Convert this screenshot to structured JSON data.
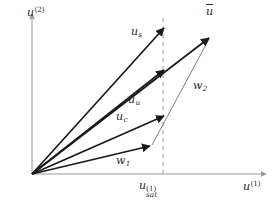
{
  "figure": {
    "background_color": "#ffffff",
    "axis_color": "#9a9a9a",
    "vector_color": "#1a1a1a",
    "thin_vector_color": "#707070",
    "dashed_line_color": "#b0b0b0",
    "text_color": "#2b2b2b",
    "width": 278,
    "height": 208
  },
  "axes": {
    "x": {
      "label_base": "u",
      "label_sup": "(1)",
      "origin_px": [
        32,
        174
      ],
      "end_px": [
        268,
        174
      ]
    },
    "y": {
      "label_base": "u",
      "label_sup": "(2)",
      "origin_px": [
        32,
        174
      ],
      "end_px": [
        32,
        12
      ]
    }
  },
  "saturation_line": {
    "name": "u_sat^(1)",
    "label_base": "u",
    "label_sub": "sat",
    "label_sup": "(1)",
    "x_px": 163,
    "style": "dashed"
  },
  "vectors": [
    {
      "id": "u_s",
      "label_base": "u",
      "label_sub": "s",
      "from_px": [
        32,
        174
      ],
      "to_px": [
        166,
        25
      ],
      "style": "thick",
      "label_px": [
        131,
        26
      ]
    },
    {
      "id": "u_u",
      "label_base": "u",
      "label_sub": "u",
      "from_px": [
        32,
        174
      ],
      "to_px": [
        166,
        68
      ],
      "style": "thick",
      "label_px": [
        128,
        94
      ]
    },
    {
      "id": "u_c",
      "label_base": "u",
      "label_sub": "c",
      "from_px": [
        32,
        174
      ],
      "to_px": [
        166,
        114
      ],
      "style": "thick",
      "label_px": [
        116,
        111
      ]
    },
    {
      "id": "w_1",
      "label_base": "w",
      "label_sub": "1",
      "from_px": [
        32,
        174
      ],
      "to_px": [
        152,
        145
      ],
      "style": "thick",
      "label_px": [
        116,
        155
      ]
    },
    {
      "id": "w_2",
      "label_base": "w",
      "label_sub": "2",
      "from_px": [
        152,
        145
      ],
      "to_px": [
        211,
        36
      ],
      "style": "thin",
      "label_px": [
        193,
        80
      ]
    },
    {
      "id": "u_bar",
      "label_base": "u",
      "label_accent": "bar",
      "from_px": [
        32,
        174
      ],
      "to_px": [
        211,
        36
      ],
      "style": "thick",
      "label_px": [
        206,
        6
      ]
    }
  ],
  "labels": {
    "y_axis": "u(2)",
    "x_axis": "u(1)",
    "u_sat": "usat(1)",
    "u_s": "us",
    "u_u": "uu",
    "u_c": "uc",
    "w_1": "w1",
    "w_2": "w2",
    "u_bar": "u"
  }
}
